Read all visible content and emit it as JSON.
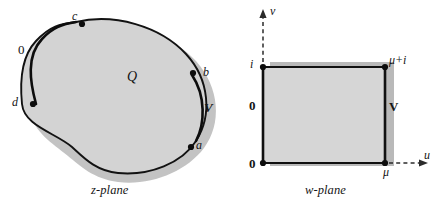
{
  "figure": {
    "colors": {
      "region_fill": "#d4d4d4",
      "rect_fill": "#d7d7d7",
      "shadow": "#b4b4b4",
      "curve": "#111111",
      "axis": "#2b2b2b",
      "background": "#ffffff"
    }
  },
  "z_plane": {
    "caption": "z-plane",
    "region_label": "Q",
    "boundary_points": [
      {
        "name": "point-a",
        "label": "a",
        "x": 196,
        "y": 145
      },
      {
        "name": "point-b",
        "label": "b",
        "x": 203,
        "y": 72
      },
      {
        "name": "point-c",
        "label": "c",
        "x": 76,
        "y": 22
      },
      {
        "name": "point-d",
        "label": "d",
        "x": 26,
        "y": 103
      }
    ],
    "arc_labels": [
      {
        "name": "arc-label-zero",
        "label": "0",
        "x": 22,
        "y": 50
      },
      {
        "name": "arc-label-V",
        "label": "V",
        "x": 205,
        "y": 108
      }
    ]
  },
  "w_plane": {
    "caption": "w-plane",
    "axes": {
      "vertical_label": "v",
      "horizontal_label": "u"
    },
    "corner_labels": [
      {
        "name": "corner-origin",
        "label": "0",
        "x": 250,
        "y": 160
      },
      {
        "name": "corner-mu",
        "label": "μ",
        "x": 385,
        "y": 167
      },
      {
        "name": "corner-mu-plus-i",
        "label": "μ+i",
        "x": 391,
        "y": 59
      },
      {
        "name": "corner-i",
        "label": "i",
        "x": 251,
        "y": 61
      }
    ],
    "edge_labels": [
      {
        "name": "edge-label-zero",
        "label": "0",
        "x": 250,
        "y": 106
      },
      {
        "name": "edge-label-V",
        "label": "V",
        "x": 390,
        "y": 107
      }
    ]
  }
}
